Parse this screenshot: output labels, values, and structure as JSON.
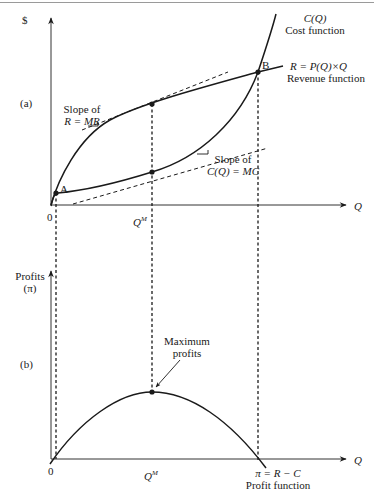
{
  "figure": {
    "panel_a": {
      "panel_label": "(a)",
      "y_axis_label": "$",
      "x_axis_label": "Q",
      "origin_label": "0",
      "qm_label": "Q",
      "qm_superscript": "M",
      "cost_curve": {
        "name": "C(Q)",
        "desc": "Cost function"
      },
      "revenue_curve": {
        "name": "R = P(Q)×Q",
        "desc": "Revenue function"
      },
      "point_a": "A",
      "point_b": "B",
      "slope_mr": {
        "line1": "Slope of",
        "line2": "R = MR"
      },
      "slope_mc": {
        "line1": "Slope of",
        "line2": "C(Q) = MC"
      }
    },
    "panel_b": {
      "panel_label": "(b)",
      "y_axis_label_1": "Profits",
      "y_axis_label_2": "(π)",
      "x_axis_label": "Q",
      "origin_label": "0",
      "qm_label": "Q",
      "qm_superscript": "M",
      "max_label_1": "Maximum",
      "max_label_2": "profits",
      "profit_curve": {
        "name": "π = R − C",
        "desc": "Profit function"
      }
    }
  }
}
